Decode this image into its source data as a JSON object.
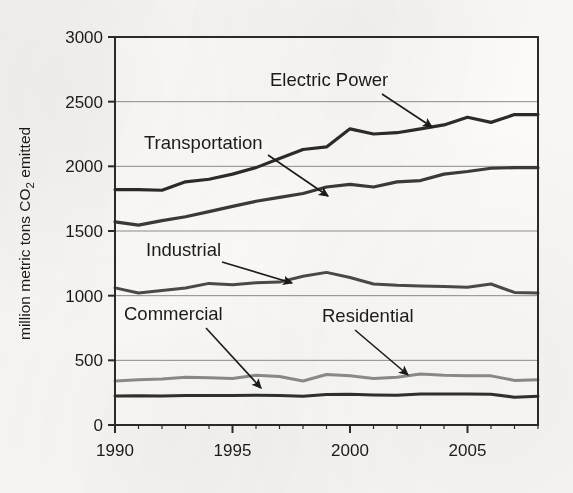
{
  "figure": {
    "name": "us-co2-emissions-by-sector-line-chart",
    "background_color": "#f7f6f3",
    "frame_color": "#2b2b2b",
    "gridline_color": "#8d8d8d"
  },
  "chart_data": {
    "type": "line",
    "title": "",
    "xlabel": "",
    "ylabel": "million metric tons CO2 emitted",
    "ylabel_parts": {
      "before": "million metric tons CO",
      "subscript": "2",
      "after": " emitted"
    },
    "xlim": [
      1990,
      2008
    ],
    "ylim": [
      0,
      3000
    ],
    "x_tick_labels": [
      "1990",
      "1995",
      "2000",
      "2005"
    ],
    "x_tick_values": [
      1990,
      1995,
      2000,
      2005
    ],
    "x_minor_tick_step": 1,
    "y_tick_labels": [
      "0",
      "500",
      "1000",
      "1500",
      "2000",
      "2500",
      "3000"
    ],
    "y_tick_values": [
      0,
      500,
      1000,
      1500,
      2000,
      2500,
      3000
    ],
    "grid": "horizontal",
    "legend": "inline-annotations",
    "x": [
      1990,
      1991,
      1992,
      1993,
      1994,
      1995,
      1996,
      1997,
      1998,
      1999,
      2000,
      2001,
      2002,
      2003,
      2004,
      2005,
      2006,
      2007,
      2008
    ],
    "series": [
      {
        "name": "Electric Power",
        "color": "#2b2b2b",
        "width": 3.2,
        "values": [
          1820,
          1820,
          1815,
          1880,
          1900,
          1940,
          1990,
          2060,
          2130,
          2150,
          2290,
          2250,
          2260,
          2290,
          2320,
          2380,
          2340,
          2400,
          2400
        ]
      },
      {
        "name": "Transportation",
        "color": "#3a3a3a",
        "width": 3.2,
        "values": [
          1570,
          1545,
          1580,
          1610,
          1650,
          1690,
          1730,
          1760,
          1790,
          1840,
          1860,
          1840,
          1880,
          1890,
          1940,
          1960,
          1985,
          1990,
          1990
        ]
      },
      {
        "name": "Industrial",
        "color": "#4a4a4a",
        "width": 3.0,
        "values": [
          1060,
          1020,
          1040,
          1060,
          1095,
          1085,
          1100,
          1105,
          1150,
          1180,
          1140,
          1090,
          1080,
          1075,
          1070,
          1065,
          1090,
          1025,
          1020
        ]
      },
      {
        "name": "Residential",
        "color": "#8c8c8c",
        "width": 3.0,
        "values": [
          340,
          350,
          355,
          370,
          365,
          360,
          385,
          375,
          340,
          390,
          380,
          360,
          370,
          395,
          385,
          380,
          380,
          345,
          350
        ]
      },
      {
        "name": "Commercial",
        "color": "#303030",
        "width": 3.0,
        "values": [
          225,
          227,
          225,
          228,
          228,
          228,
          230,
          229,
          222,
          235,
          238,
          232,
          230,
          240,
          240,
          240,
          238,
          215,
          222
        ]
      }
    ],
    "annotations": [
      {
        "label": "Electric Power",
        "label_x": 270,
        "label_y": 86,
        "anchor": "start",
        "arrow_from": [
          382,
          94
        ],
        "arrow_to": [
          432,
          127
        ]
      },
      {
        "label": "Transportation",
        "label_x": 144,
        "label_y": 149,
        "anchor": "start",
        "arrow_from": [
          268,
          155
        ],
        "arrow_to": [
          328,
          196
        ]
      },
      {
        "label": "Industrial",
        "label_x": 146,
        "label_y": 256,
        "anchor": "start",
        "arrow_from": [
          222,
          262
        ],
        "arrow_to": [
          292,
          283
        ]
      },
      {
        "label": "Commercial",
        "label_x": 124,
        "label_y": 320,
        "anchor": "start",
        "arrow_from": [
          206,
          328
        ],
        "arrow_to": [
          261,
          388
        ]
      },
      {
        "label": "Residential",
        "label_x": 322,
        "label_y": 322,
        "anchor": "start",
        "arrow_from": [
          355,
          330
        ],
        "arrow_to": [
          408,
          375
        ]
      }
    ]
  }
}
